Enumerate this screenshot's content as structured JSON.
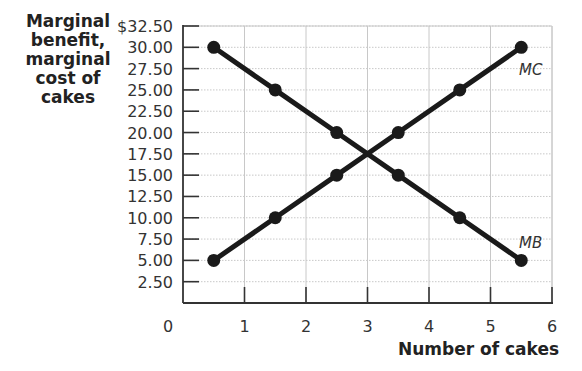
{
  "chart_data": {
    "type": "line",
    "title": "",
    "xlabel": "Number of cakes",
    "ylabel": "Marginal benefit, marginal cost of cakes",
    "xlim": [
      0,
      6
    ],
    "ylim": [
      0,
      32.5
    ],
    "grid": true,
    "x_ticks": [
      "0",
      "1",
      "2",
      "3",
      "4",
      "5",
      "6"
    ],
    "y_ticks": [
      "$32.50",
      "30.00",
      "27.50",
      "25.00",
      "22.50",
      "20.00",
      "17.50",
      "15.00",
      "12.50",
      "10.00",
      "7.50",
      "5.00",
      "2.50"
    ],
    "x": [
      0.5,
      1.5,
      2.5,
      3.5,
      4.5,
      5.5
    ],
    "series": [
      {
        "name": "MB",
        "values": [
          30,
          25,
          20,
          15,
          10,
          5
        ]
      },
      {
        "name": "MC",
        "values": [
          5,
          10,
          15,
          20,
          25,
          30
        ]
      }
    ],
    "annotations": [
      {
        "text": "MC",
        "near": [
          5.5,
          30
        ]
      },
      {
        "text": "MB",
        "near": [
          5.5,
          5
        ]
      }
    ]
  },
  "labels": {
    "ylabel_lines": [
      "Marginal",
      "benefit,",
      "marginal",
      "cost of",
      "cakes"
    ],
    "xlabel": "Number of cakes",
    "mc": "MC",
    "mb": "MB"
  }
}
